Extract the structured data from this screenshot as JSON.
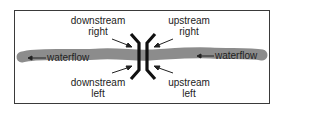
{
  "diagram": {
    "labels": {
      "downstream_right": {
        "line1": "downstream",
        "line2": "right"
      },
      "downstream_left": {
        "line1": "downstream",
        "line2": "left"
      },
      "upstream_right": {
        "line1": "upstream",
        "line2": "right"
      },
      "upstream_left": {
        "line1": "upstream",
        "line2": "left"
      }
    },
    "waterflow_left": "waterflow",
    "waterflow_right": "waterflow",
    "colors": {
      "river": "#8c8c8c",
      "bridge": "#111111",
      "border": "#3a3a3a",
      "text": "#222222"
    }
  }
}
